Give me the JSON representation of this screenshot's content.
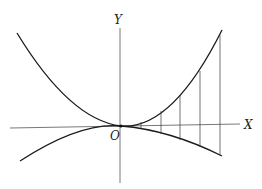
{
  "diagram": {
    "type": "curves-between-graphs",
    "labels": {
      "y_axis": "Y",
      "x_axis": "X",
      "origin": "O"
    },
    "colors": {
      "curve": "#1a1a1a",
      "axis": "#555555",
      "ordinate": "#333333",
      "background": "#ffffff"
    },
    "origin_px": [
      121,
      126
    ],
    "upper_curve_points": [
      [
        17,
        33
      ],
      [
        40,
        62
      ],
      [
        60,
        86
      ],
      [
        80,
        104
      ],
      [
        100,
        118
      ],
      [
        121,
        126
      ],
      [
        141,
        122
      ],
      [
        161,
        110
      ],
      [
        180,
        94
      ],
      [
        200,
        70
      ],
      [
        222,
        30
      ]
    ],
    "lower_curve_points": [
      [
        20,
        161
      ],
      [
        45,
        149
      ],
      [
        70,
        139
      ],
      [
        95,
        131
      ],
      [
        121,
        126
      ],
      [
        141,
        129
      ],
      [
        161,
        134
      ],
      [
        180,
        141
      ],
      [
        200,
        149
      ],
      [
        222,
        156
      ]
    ],
    "ordinates": [
      {
        "x": 141,
        "y_top": 122,
        "y_bottom": 129
      },
      {
        "x": 161,
        "y_top": 110,
        "y_bottom": 134
      },
      {
        "x": 180,
        "y_top": 94,
        "y_bottom": 141
      },
      {
        "x": 200,
        "y_top": 70,
        "y_bottom": 149
      },
      {
        "x": 220,
        "y_top": 35,
        "y_bottom": 155
      }
    ]
  }
}
